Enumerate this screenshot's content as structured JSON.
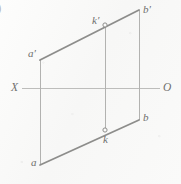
{
  "figure": {
    "kind": "descriptive-geometry-projection-diagram",
    "partial_enumerator": ")",
    "background_color": "#fbfbfa",
    "stroke_color_heavy": "#8d8d8b",
    "stroke_color_light": "#b2b2b0",
    "axis_color": "#bdbdbb",
    "label_color": "#6f6f6d",
    "labels": [
      {
        "id": "b-prime",
        "text": "b′",
        "x": 143,
        "y": 4
      },
      {
        "id": "k-prime",
        "text": "k′",
        "x": 92,
        "y": 15
      },
      {
        "id": "a-prime",
        "text": "a′",
        "x": 28,
        "y": 48
      },
      {
        "id": "x-axis-left",
        "text": "X",
        "x": 11,
        "y": 82
      },
      {
        "id": "o-axis-right",
        "text": "O",
        "x": 163,
        "y": 82
      },
      {
        "id": "b-point",
        "text": "b",
        "x": 143,
        "y": 112
      },
      {
        "id": "k-point",
        "text": "k",
        "x": 103,
        "y": 134
      },
      {
        "id": "a-point",
        "text": "a",
        "x": 31,
        "y": 157
      }
    ],
    "geometry": {
      "vertices": {
        "a_prime": [
          40,
          60
        ],
        "b_prime": [
          139,
          10
        ],
        "b": [
          139,
          120
        ],
        "a": [
          40,
          165
        ],
        "k_prime": [
          105,
          25
        ],
        "k": [
          105,
          130
        ]
      },
      "heavy_edges": [
        {
          "id": "edge-a-prime-b-prime",
          "from": [
            40,
            60
          ],
          "to": [
            139,
            10
          ]
        },
        {
          "id": "edge-a-b",
          "from": [
            40,
            165
          ],
          "to": [
            139,
            120
          ]
        }
      ],
      "light_edges": [
        {
          "id": "edge-left-vertical",
          "from": [
            40,
            60
          ],
          "to": [
            40,
            165
          ]
        },
        {
          "id": "edge-right-vertical",
          "from": [
            139,
            10
          ],
          "to": [
            139,
            120
          ]
        },
        {
          "id": "edge-k-connector",
          "from": [
            105,
            25
          ],
          "to": [
            105,
            130
          ]
        }
      ],
      "axis": {
        "id": "axis-x-o",
        "from": [
          22,
          88
        ],
        "to": [
          160,
          88
        ]
      },
      "point_markers": [
        {
          "id": "marker-k-prime",
          "cx": 105,
          "cy": 25,
          "r": 2.1
        },
        {
          "id": "marker-k",
          "cx": 105,
          "cy": 130,
          "r": 2.1
        }
      ]
    }
  }
}
